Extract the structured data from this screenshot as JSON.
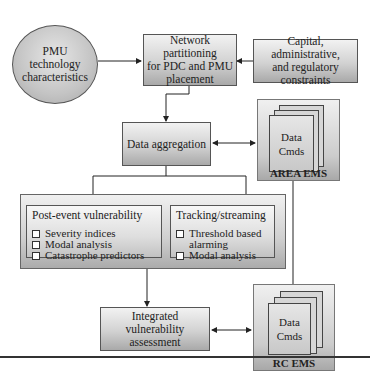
{
  "diagram": {
    "nodes": {
      "pmu_tech": {
        "label": "PMU technology characteristics",
        "lines": [
          "PMU",
          "technology",
          "characteristics"
        ],
        "shape": "circle"
      },
      "network_partitioning": {
        "label": "Network partitioning for PDC and PMU placement",
        "lines": [
          "Network partitioning",
          "for PDC and PMU",
          "placement"
        ]
      },
      "constraints": {
        "label": "Capital, administrative, and regulatory constraints",
        "lines": [
          "Capital, administrative,",
          "and regulatory",
          "constraints"
        ]
      },
      "data_aggregation": {
        "label": "Data aggregation"
      },
      "area_ems": {
        "title": "AREA EMS",
        "lines": [
          "Data",
          "Cmds"
        ]
      },
      "post_event": {
        "title": "Post-event vulnerability",
        "items": [
          "Severity indices",
          "Modal analysis",
          "Catastrophe predictors"
        ]
      },
      "tracking": {
        "title": "Tracking/streaming",
        "items": [
          "Threshold based alarming",
          "Modal analysis"
        ],
        "item_lines": [
          [
            "Threshold based",
            "alarming"
          ],
          [
            "Modal analysis"
          ]
        ]
      },
      "integrated": {
        "label": "Integrated vulnerability assessment",
        "lines": [
          "Integrated vulnerability",
          "assessment"
        ]
      },
      "rc_ems": {
        "title": "RC EMS",
        "lines": [
          "Data",
          "Cmds"
        ]
      }
    },
    "edges": [
      {
        "from": "pmu_tech",
        "to": "network_partitioning"
      },
      {
        "from": "constraints",
        "to": "network_partitioning"
      },
      {
        "from": "network_partitioning",
        "to": "data_aggregation"
      },
      {
        "from": "data_aggregation",
        "to": "area_ems",
        "bidirectional": true
      },
      {
        "from": "data_aggregation",
        "to": "post_event"
      },
      {
        "from": "data_aggregation",
        "to": "tracking"
      },
      {
        "from": "analysis_group",
        "to": "integrated"
      },
      {
        "from": "area_ems",
        "to": "rc_ems"
      },
      {
        "from": "integrated",
        "to": "rc_ems",
        "bidirectional": true
      }
    ]
  }
}
